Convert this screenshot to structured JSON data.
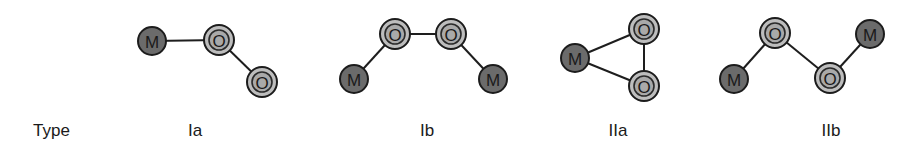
{
  "row_label": "Type",
  "structures": [
    {
      "id": "Ia",
      "caption": "Ia",
      "caption_x": 195,
      "atoms": [
        {
          "element": "M",
          "x": 152,
          "y": 41
        },
        {
          "element": "O",
          "x": 219,
          "y": 40
        },
        {
          "element": "O",
          "x": 262,
          "y": 82
        }
      ],
      "bonds": [
        [
          0,
          1
        ],
        [
          1,
          2
        ]
      ]
    },
    {
      "id": "Ib",
      "caption": "Ib",
      "caption_x": 427,
      "atoms": [
        {
          "element": "M",
          "x": 354,
          "y": 79
        },
        {
          "element": "O",
          "x": 395,
          "y": 34
        },
        {
          "element": "O",
          "x": 451,
          "y": 34
        },
        {
          "element": "M",
          "x": 493,
          "y": 79
        }
      ],
      "bonds": [
        [
          0,
          1
        ],
        [
          1,
          2
        ],
        [
          2,
          3
        ]
      ]
    },
    {
      "id": "IIa",
      "caption": "IIa",
      "caption_x": 618,
      "atoms": [
        {
          "element": "M",
          "x": 575,
          "y": 58
        },
        {
          "element": "O",
          "x": 644,
          "y": 29
        },
        {
          "element": "O",
          "x": 644,
          "y": 86
        }
      ],
      "bonds": [
        [
          0,
          1
        ],
        [
          0,
          2
        ],
        [
          1,
          2
        ]
      ]
    },
    {
      "id": "IIb",
      "caption": "IIb",
      "caption_x": 831,
      "atoms": [
        {
          "element": "M",
          "x": 734,
          "y": 79
        },
        {
          "element": "O",
          "x": 775,
          "y": 33
        },
        {
          "element": "O",
          "x": 830,
          "y": 78
        },
        {
          "element": "M",
          "x": 870,
          "y": 34
        }
      ],
      "bonds": [
        [
          0,
          1
        ],
        [
          1,
          2
        ],
        [
          2,
          3
        ]
      ]
    }
  ],
  "colors": {
    "metal_fill": "#6b6b6b",
    "oxygen_fill": "#bdbdbd",
    "oxygen_inner": "#a9a9a9",
    "bond": "#1e1e1e",
    "text": "#1a1a1a"
  }
}
